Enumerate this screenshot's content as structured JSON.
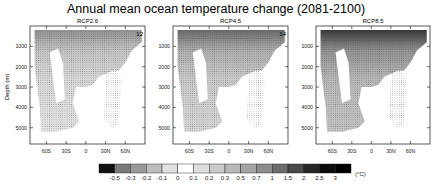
{
  "chart_data": {
    "type": "heatmap",
    "title": "Annual mean ocean temperature change (2081-2100)",
    "ylabel": "Depth (m)",
    "xlabel": "",
    "x_ticks": [
      "60S",
      "30S",
      "0",
      "30N",
      "60N"
    ],
    "x_tick_values": [
      -60,
      -30,
      0,
      30,
      60
    ],
    "xlim": [
      -85,
      90
    ],
    "y_ticks": [
      "1000",
      "2000",
      "3000",
      "4000",
      "5000"
    ],
    "y_tick_values": [
      1000,
      2000,
      3000,
      4000,
      5000
    ],
    "ylim": [
      5800,
      0
    ],
    "panels": [
      {
        "name": "RCP2.6",
        "count_label": "12",
        "intensity": 0.55
      },
      {
        "name": "RCP4.5",
        "count_label": "14",
        "intensity": 0.75
      },
      {
        "name": "RCP8.5",
        "count_label": "",
        "intensity": 1.0
      }
    ],
    "colorbar": {
      "levels": [
        "-0.5",
        "-0.3",
        "-0.2",
        "-0.1",
        "0",
        "0.1",
        "0.2",
        "0.3",
        "0.5",
        "0.7",
        "1",
        "1.5",
        "2",
        "2.5",
        "3"
      ],
      "colors": [
        "#111111",
        "#7a7a7a",
        "#9a9a9a",
        "#bdbdbd",
        "#e0e0e0",
        "#ffffff",
        "#dedede",
        "#cacaca",
        "#b8b8b8",
        "#a4a4a4",
        "#8c8c8c",
        "#6e6e6e",
        "#4a4a4a",
        "#262626",
        "#0c0c0c",
        "#000000"
      ],
      "units": "(°C)"
    },
    "legend": "bottom",
    "grid": false,
    "stippling": "hatched dots indicate model agreement"
  }
}
